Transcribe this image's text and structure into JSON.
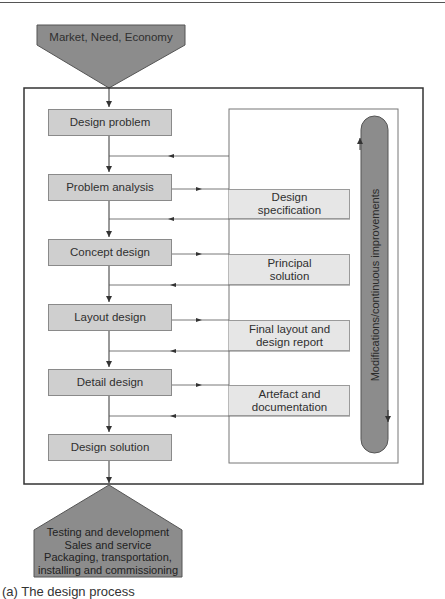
{
  "input": {
    "label": "Market, Need, Economy"
  },
  "steps": [
    {
      "label": "Design problem"
    },
    {
      "label": "Problem analysis"
    },
    {
      "label": "Concept design"
    },
    {
      "label": "Layout design"
    },
    {
      "label": "Detail design"
    },
    {
      "label": "Design solution"
    }
  ],
  "outputs": [
    {
      "line1": "Design",
      "line2": "specification"
    },
    {
      "line1": "Principal",
      "line2": "solution"
    },
    {
      "line1": "Final layout and",
      "line2": "design report"
    },
    {
      "line1": "Artefact and",
      "line2": "documentation"
    }
  ],
  "feedback": {
    "label": "Modifications/continuous improvements"
  },
  "result": {
    "lines": [
      "Testing and development",
      "Sales and service",
      "Packaging, transportation,",
      "installing and commissioning"
    ]
  },
  "caption": "(a) The design process",
  "colors": {
    "dark_fill": "#8c8c8c",
    "step_fill": "#cfcfcf",
    "output_fill": "#e6e6e6",
    "line": "#444444"
  }
}
